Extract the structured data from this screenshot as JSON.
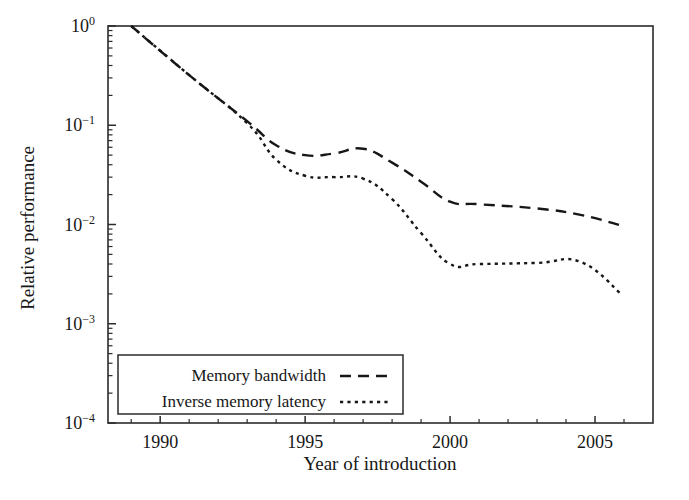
{
  "chart_data": {
    "type": "line",
    "title": "",
    "xlabel": "Year of introduction",
    "ylabel": "Relative performance",
    "xlim": [
      1988.2,
      2007.0
    ],
    "ylim": [
      0.0001,
      1.0
    ],
    "yscale": "log",
    "grid": false,
    "legend_position": "bottom-left",
    "xticks": [
      1990,
      1995,
      2000,
      2005
    ],
    "xtick_labels": [
      "1990",
      "1995",
      "2000",
      "2005"
    ],
    "yticks": [
      1,
      0.1,
      0.01,
      0.001,
      0.0001
    ],
    "ytick_labels": [
      "10⁰",
      "10⁻¹",
      "10⁻²",
      "10⁻³",
      "10⁻⁴"
    ],
    "ytick_mantissas": [
      "10",
      "10",
      "10",
      "10",
      "10"
    ],
    "ytick_exponents": [
      "0",
      "-1",
      "-2",
      "-3",
      "-4"
    ],
    "series": [
      {
        "name": "Memory bandwidth",
        "dash": "long-dash",
        "color": "#171717",
        "x": [
          1989.0,
          1991.0,
          1993.0,
          1994.0,
          1995.0,
          1996.0,
          1997.0,
          1998.0,
          1999.0,
          2000.0,
          2001.0,
          2003.0,
          2004.5,
          2005.9
        ],
        "y": [
          1.0,
          0.32,
          0.11,
          0.063,
          0.05,
          0.052,
          0.058,
          0.042,
          0.027,
          0.017,
          0.016,
          0.0145,
          0.0125,
          0.0098
        ]
      },
      {
        "name": "Inverse memory latency",
        "dash": "dotted",
        "color": "#171717",
        "x": [
          1989.0,
          1991.0,
          1993.0,
          1994.0,
          1995.0,
          1996.0,
          1997.0,
          1998.0,
          1999.0,
          2000.0,
          2001.0,
          2003.0,
          2004.5,
          2005.9
        ],
        "y": [
          1.0,
          0.32,
          0.105,
          0.045,
          0.031,
          0.03,
          0.029,
          0.018,
          0.0082,
          0.004,
          0.004,
          0.0041,
          0.0042,
          0.002
        ]
      }
    ]
  },
  "legend": {
    "entries": [
      {
        "label": "Memory bandwidth"
      },
      {
        "label": "Inverse memory latency"
      }
    ]
  },
  "axes": {
    "x_title": "Year of introduction",
    "y_title": "Relative performance"
  }
}
